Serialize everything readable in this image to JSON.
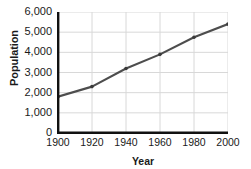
{
  "chart_data": {
    "type": "line",
    "title": "",
    "xlabel": "Year",
    "ylabel": "Population",
    "x": [
      1900,
      1920,
      1940,
      1960,
      1980,
      2000
    ],
    "values": [
      1800,
      2300,
      3200,
      3900,
      4750,
      5400
    ],
    "series": [
      {
        "name": "Population",
        "values": [
          1800,
          2300,
          3200,
          3900,
          4750,
          5400
        ]
      }
    ],
    "xlim": [
      1900,
      2000
    ],
    "ylim": [
      0,
      6000
    ],
    "xticks": [
      1900,
      1920,
      1940,
      1960,
      1980,
      2000
    ],
    "xtick_labels": [
      "1900",
      "1920",
      "1940",
      "1960",
      "1980",
      "2000"
    ],
    "yticks": [
      0,
      1000,
      2000,
      3000,
      4000,
      5000,
      6000
    ],
    "ytick_labels": [
      "0",
      "1,000",
      "2,000",
      "3,000",
      "4,000",
      "5,000",
      "6,000"
    ],
    "grid": true,
    "grid_color": "#d8d8d8",
    "line_color": "#4d4d4d",
    "marker_color": "#3a3a3a",
    "axis_color": "#111111",
    "legend": null,
    "legend_position": "none",
    "annotations": []
  },
  "axes": {
    "y_title": "Population",
    "x_title": "Year"
  }
}
